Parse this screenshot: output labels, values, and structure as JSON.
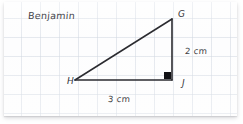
{
  "worksheet": {
    "student_name": "Benjamin",
    "paper": {
      "type": "grid-paper",
      "grid_spacing_px": 19,
      "grid_color": "#c4ccd8",
      "background_color": "#fdfdfe"
    }
  },
  "figure": {
    "type": "right-triangle",
    "stroke_color": "#2b2b30",
    "right_angle_marker": {
      "name": "right-angle-square",
      "filled": true,
      "color": "#111115",
      "at_vertex": "J"
    },
    "vertices": [
      {
        "label": "G",
        "x": 172,
        "y": 21,
        "position": "top-right"
      },
      {
        "label": "H",
        "x": 75,
        "y": 82,
        "position": "bottom-left"
      },
      {
        "label": "J",
        "x": 172,
        "y": 82,
        "position": "bottom-right"
      }
    ],
    "sides": [
      {
        "name": "GJ",
        "label": "2 cm",
        "value": 2,
        "unit": "cm",
        "orientation": "vertical"
      },
      {
        "name": "HJ",
        "label": "3 cm",
        "value": 3,
        "unit": "cm",
        "orientation": "horizontal"
      },
      {
        "name": "HG",
        "label": "",
        "orientation": "hypotenuse"
      }
    ]
  }
}
